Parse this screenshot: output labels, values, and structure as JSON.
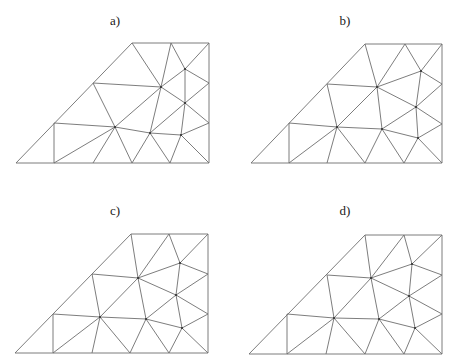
{
  "figure": {
    "panels": [
      {
        "id": "a",
        "label": "a)",
        "label_pos": [
          115,
          14
        ],
        "vertices": {
          "B0": [
            16,
            163
          ],
          "B1": [
            54,
            163
          ],
          "B2": [
            93,
            163
          ],
          "B3": [
            132,
            163
          ],
          "B4": [
            170,
            163
          ],
          "B5": [
            209,
            163
          ],
          "L1": [
            54,
            123
          ],
          "L2": [
            93,
            83
          ],
          "T0": [
            132,
            43
          ],
          "T1": [
            171,
            43
          ],
          "T2": [
            209,
            43
          ],
          "R1": [
            209,
            83
          ],
          "R2": [
            209,
            123
          ],
          "I1": [
            115,
            127
          ],
          "I2": [
            161,
            87
          ],
          "I3": [
            185,
            69
          ],
          "I4": [
            185,
            103
          ],
          "I5": [
            150,
            133
          ],
          "I6": [
            181,
            135
          ]
        },
        "interior_nodes": [
          "I1",
          "I2",
          "I3",
          "I4",
          "I5",
          "I6"
        ],
        "edges": [
          [
            "B0",
            "B5"
          ],
          [
            "B5",
            "T2"
          ],
          [
            "T2",
            "T0"
          ],
          [
            "T0",
            "B0"
          ],
          [
            "L1",
            "B1"
          ],
          [
            "L1",
            "I1"
          ],
          [
            "B1",
            "I1"
          ],
          [
            "I1",
            "B2"
          ],
          [
            "I1",
            "B3"
          ],
          [
            "L2",
            "I1"
          ],
          [
            "L2",
            "I2"
          ],
          [
            "T0",
            "I2"
          ],
          [
            "I1",
            "I2"
          ],
          [
            "T1",
            "I2"
          ],
          [
            "T1",
            "I3"
          ],
          [
            "I3",
            "T2"
          ],
          [
            "I2",
            "I3"
          ],
          [
            "I3",
            "R1"
          ],
          [
            "I3",
            "I4"
          ],
          [
            "I2",
            "I4"
          ],
          [
            "I4",
            "R1"
          ],
          [
            "I4",
            "R2"
          ],
          [
            "I2",
            "I5"
          ],
          [
            "I4",
            "I5"
          ],
          [
            "I1",
            "I5"
          ],
          [
            "I5",
            "I6"
          ],
          [
            "I6",
            "I4"
          ],
          [
            "I6",
            "R2"
          ],
          [
            "I6",
            "B5"
          ],
          [
            "I6",
            "B4"
          ],
          [
            "I5",
            "B4"
          ],
          [
            "I5",
            "B3"
          ]
        ]
      },
      {
        "id": "b",
        "label": "b)",
        "label_pos": [
          345,
          14
        ],
        "vertices": {
          "B0": [
            251,
            163
          ],
          "B1": [
            289,
            163
          ],
          "B2": [
            327,
            163
          ],
          "B3": [
            365,
            163
          ],
          "B4": [
            404,
            163
          ],
          "B5": [
            442,
            163
          ],
          "L1": [
            289,
            123
          ],
          "L2": [
            327,
            84
          ],
          "T0": [
            365,
            44
          ],
          "T1": [
            405,
            44
          ],
          "T2": [
            442,
            44
          ],
          "R1": [
            442,
            84
          ],
          "R2": [
            442,
            124
          ],
          "J1": [
            337,
            127
          ],
          "J2": [
            377,
            87
          ],
          "J3": [
            382,
            129
          ],
          "J4": [
            421,
            71
          ],
          "J5": [
            416,
            107
          ],
          "J6": [
            418,
            138
          ]
        },
        "interior_nodes": [
          "J1",
          "J2",
          "J3",
          "J4",
          "J5",
          "J6"
        ],
        "edges": [
          [
            "B0",
            "B5"
          ],
          [
            "B5",
            "T2"
          ],
          [
            "T2",
            "T0"
          ],
          [
            "T0",
            "B0"
          ],
          [
            "L1",
            "B1"
          ],
          [
            "L1",
            "J1"
          ],
          [
            "B1",
            "J1"
          ],
          [
            "J1",
            "B2"
          ],
          [
            "J1",
            "B3"
          ],
          [
            "L2",
            "J1"
          ],
          [
            "L2",
            "J2"
          ],
          [
            "T0",
            "J2"
          ],
          [
            "J1",
            "J2"
          ],
          [
            "T1",
            "J2"
          ],
          [
            "T1",
            "J4"
          ],
          [
            "J4",
            "T2"
          ],
          [
            "J4",
            "R1"
          ],
          [
            "J2",
            "J4"
          ],
          [
            "J2",
            "J5"
          ],
          [
            "J4",
            "J5"
          ],
          [
            "J5",
            "R1"
          ],
          [
            "J5",
            "R2"
          ],
          [
            "J2",
            "J3"
          ],
          [
            "J1",
            "J3"
          ],
          [
            "J3",
            "J5"
          ],
          [
            "J3",
            "J6"
          ],
          [
            "J5",
            "J6"
          ],
          [
            "J6",
            "R2"
          ],
          [
            "J6",
            "B5"
          ],
          [
            "J6",
            "B4"
          ],
          [
            "J3",
            "B4"
          ],
          [
            "J3",
            "B3"
          ]
        ]
      },
      {
        "id": "c",
        "label": "c)",
        "label_pos": [
          115,
          204
        ],
        "vertices": {
          "B0": [
            15,
            353
          ],
          "B1": [
            53,
            353
          ],
          "B2": [
            92,
            353
          ],
          "B3": [
            130,
            353
          ],
          "B4": [
            169,
            353
          ],
          "B5": [
            208,
            353
          ],
          "L1": [
            53,
            314
          ],
          "L2": [
            92,
            274
          ],
          "T0": [
            131,
            234
          ],
          "T1": [
            169,
            234
          ],
          "T2": [
            208,
            234
          ],
          "R1": [
            208,
            274
          ],
          "R2": [
            208,
            314
          ],
          "J1": [
            100,
            317
          ],
          "J2": [
            138,
            278
          ],
          "J3": [
            146,
            319
          ],
          "J4": [
            180,
            263
          ],
          "J5": [
            176,
            295
          ],
          "J6": [
            182,
            328
          ]
        },
        "interior_nodes": [
          "J1",
          "J2",
          "J3",
          "J4",
          "J5",
          "J6"
        ],
        "edges": [
          [
            "B0",
            "B5"
          ],
          [
            "B5",
            "T2"
          ],
          [
            "T2",
            "T0"
          ],
          [
            "T0",
            "B0"
          ],
          [
            "L1",
            "B1"
          ],
          [
            "L1",
            "J1"
          ],
          [
            "B1",
            "J1"
          ],
          [
            "J1",
            "B2"
          ],
          [
            "J1",
            "B3"
          ],
          [
            "L2",
            "J1"
          ],
          [
            "L2",
            "J2"
          ],
          [
            "T0",
            "J2"
          ],
          [
            "J1",
            "J2"
          ],
          [
            "T1",
            "J2"
          ],
          [
            "T1",
            "J4"
          ],
          [
            "J4",
            "T2"
          ],
          [
            "J4",
            "R1"
          ],
          [
            "J2",
            "J4"
          ],
          [
            "J2",
            "J5"
          ],
          [
            "J4",
            "J5"
          ],
          [
            "J5",
            "R1"
          ],
          [
            "J5",
            "R2"
          ],
          [
            "J2",
            "J3"
          ],
          [
            "J1",
            "J3"
          ],
          [
            "J3",
            "J5"
          ],
          [
            "J3",
            "J6"
          ],
          [
            "J5",
            "J6"
          ],
          [
            "J6",
            "R2"
          ],
          [
            "J6",
            "B5"
          ],
          [
            "J6",
            "B4"
          ],
          [
            "J3",
            "B4"
          ],
          [
            "J3",
            "B3"
          ]
        ]
      },
      {
        "id": "d",
        "label": "d)",
        "label_pos": [
          345,
          204
        ],
        "vertices": {
          "B0": [
            249,
            354
          ],
          "B1": [
            287,
            354
          ],
          "B2": [
            326,
            354
          ],
          "B3": [
            365,
            354
          ],
          "B4": [
            404,
            354
          ],
          "B5": [
            442,
            354
          ],
          "L1": [
            287,
            314
          ],
          "L2": [
            327,
            275
          ],
          "T0": [
            365,
            235
          ],
          "T1": [
            404,
            235
          ],
          "T2": [
            442,
            235
          ],
          "R1": [
            442,
            275
          ],
          "R2": [
            442,
            314
          ],
          "J1": [
            334,
            318
          ],
          "J2": [
            371,
            278
          ],
          "J3": [
            379,
            319
          ],
          "J4": [
            412,
            264
          ],
          "J5": [
            409,
            296
          ],
          "J6": [
            415,
            328
          ]
        },
        "interior_nodes": [
          "J1",
          "J2",
          "J3",
          "J4",
          "J5",
          "J6"
        ],
        "edges": [
          [
            "B0",
            "B5"
          ],
          [
            "B5",
            "T2"
          ],
          [
            "T2",
            "T0"
          ],
          [
            "T0",
            "B0"
          ],
          [
            "L1",
            "B1"
          ],
          [
            "L1",
            "J1"
          ],
          [
            "B1",
            "J1"
          ],
          [
            "J1",
            "B2"
          ],
          [
            "J1",
            "B3"
          ],
          [
            "L2",
            "J1"
          ],
          [
            "L2",
            "J2"
          ],
          [
            "T0",
            "J2"
          ],
          [
            "J1",
            "J2"
          ],
          [
            "T1",
            "J2"
          ],
          [
            "T1",
            "J4"
          ],
          [
            "J4",
            "T2"
          ],
          [
            "J4",
            "R1"
          ],
          [
            "J2",
            "J4"
          ],
          [
            "J2",
            "J5"
          ],
          [
            "J4",
            "J5"
          ],
          [
            "J5",
            "R1"
          ],
          [
            "J5",
            "R2"
          ],
          [
            "J2",
            "J3"
          ],
          [
            "J1",
            "J3"
          ],
          [
            "J3",
            "J5"
          ],
          [
            "J3",
            "J6"
          ],
          [
            "J5",
            "J6"
          ],
          [
            "J6",
            "R2"
          ],
          [
            "J6",
            "B5"
          ],
          [
            "J6",
            "B4"
          ],
          [
            "J3",
            "B4"
          ],
          [
            "J3",
            "B3"
          ]
        ]
      }
    ]
  }
}
